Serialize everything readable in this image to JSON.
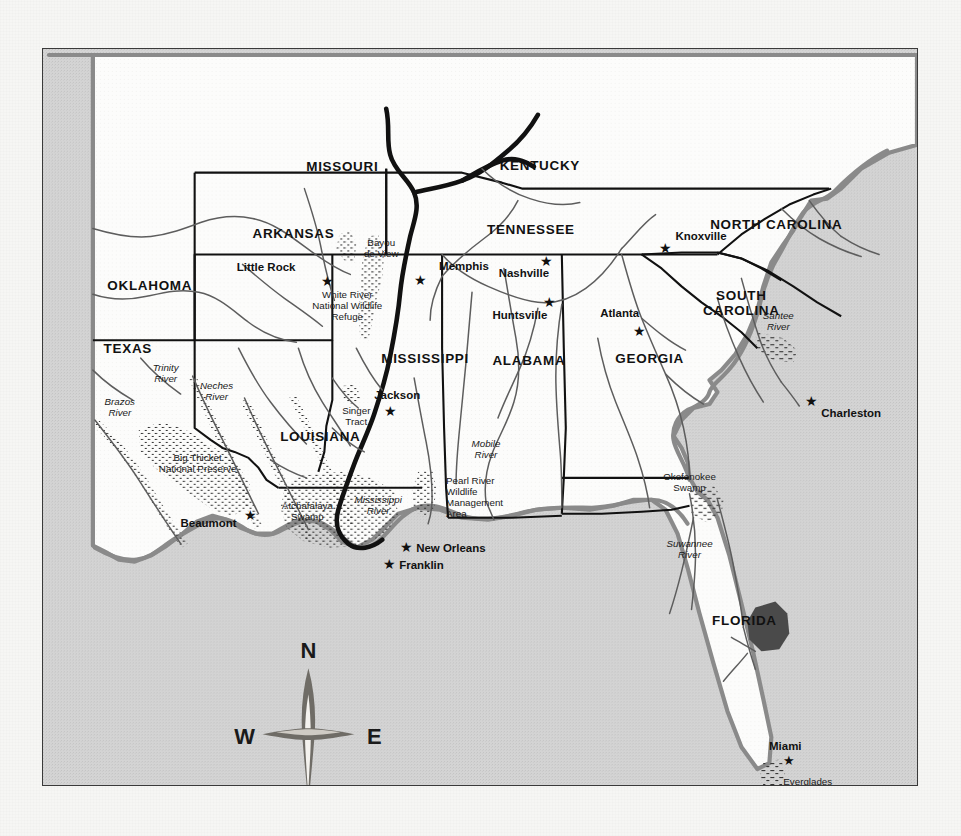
{
  "map": {
    "title": "Southeastern United States — Ivory-billed Woodpecker historic range map",
    "frame": {
      "border_color": "#3a3a3a",
      "ocean_color": "#d2d2d2",
      "land_color": "#fbfbfa"
    },
    "states": [
      {
        "name": "MISSOURI",
        "x": 300,
        "y": 122
      },
      {
        "name": "KENTUCKY",
        "x": 498,
        "y": 121
      },
      {
        "name": "ARKANSAS",
        "x": 251,
        "y": 190
      },
      {
        "name": "TENNESSEE",
        "x": 489,
        "y": 186
      },
      {
        "name": "NORTH CAROLINA",
        "x": 735,
        "y": 180
      },
      {
        "name": "OKLAHOMA",
        "x": 107,
        "y": 242
      },
      {
        "name": "SOUTH CAROLINA",
        "x": 700,
        "y": 258
      },
      {
        "name": "TEXAS",
        "x": 85,
        "y": 305
      },
      {
        "name": "MISSISSIPPI",
        "x": 383,
        "y": 315
      },
      {
        "name": "ALABAMA",
        "x": 487,
        "y": 317
      },
      {
        "name": "GEORGIA",
        "x": 608,
        "y": 315
      },
      {
        "name": "LOUISIANA",
        "x": 278,
        "y": 393
      },
      {
        "name": "FLORIDA",
        "x": 703,
        "y": 578
      }
    ],
    "cities": [
      {
        "name": "Little Rock",
        "lx": 253,
        "ly": 223,
        "sx": 285,
        "sy": 233,
        "anchor": "end"
      },
      {
        "name": "Memphis",
        "lx": 397,
        "ly": 222,
        "sx": 374,
        "sy": 232,
        "anchor": "start"
      },
      {
        "name": "Nashville",
        "lx": 482,
        "ly": 226,
        "sx": 505,
        "sy": 214,
        "anchor": "middle"
      },
      {
        "name": "Knoxville",
        "lx": 634,
        "ly": 192,
        "sx": 609,
        "sy": 201,
        "anchor": "start"
      },
      {
        "name": "Huntsville",
        "lx": 478,
        "ly": 268,
        "sx": 508,
        "sy": 255,
        "anchor": "middle"
      },
      {
        "name": "Atlanta",
        "lx": 578,
        "ly": 269,
        "sx": 598,
        "sy": 284,
        "anchor": "middle"
      },
      {
        "name": "Charleston",
        "lx": 780,
        "ly": 366,
        "sx": 755,
        "sy": 355,
        "anchor": "start"
      },
      {
        "name": "Jackson",
        "lx": 355,
        "ly": 351,
        "sx": 373,
        "sy": 363,
        "anchor": "middle"
      },
      {
        "name": "Beaumont",
        "lx": 166,
        "ly": 476,
        "sx": 196,
        "sy": 470,
        "anchor": "middle"
      },
      {
        "name": "New Orleans",
        "lx": 374,
        "ly": 501,
        "sx": 361,
        "sy": 498,
        "anchor": "start"
      },
      {
        "name": "Franklin",
        "lx": 357,
        "ly": 517,
        "sx": 333,
        "sy": 513,
        "anchor": "start"
      },
      {
        "name": "Miami",
        "lx": 744,
        "ly": 700,
        "sx": 746,
        "sy": 712,
        "anchor": "middle"
      }
    ],
    "features": [
      {
        "name": "Bayou\nde View",
        "x": 339,
        "y": 198,
        "italic": false,
        "align": "middle"
      },
      {
        "name": "White River\nNational Wildlife\nRefuge",
        "x": 305,
        "y": 257,
        "italic": false,
        "align": "middle"
      },
      {
        "name": "Trinity\nRiver",
        "x": 123,
        "y": 323,
        "italic": true,
        "align": "middle"
      },
      {
        "name": "Neches\nRiver",
        "x": 174,
        "y": 341,
        "italic": true,
        "align": "middle"
      },
      {
        "name": "Brazos\nRiver",
        "x": 77,
        "y": 357,
        "italic": true,
        "align": "middle"
      },
      {
        "name": "Big Thicket\nNational Preserve",
        "x": 155,
        "y": 413,
        "italic": false,
        "align": "middle"
      },
      {
        "name": "Singer\nTract",
        "x": 314,
        "y": 366,
        "italic": false,
        "align": "middle"
      },
      {
        "name": "Atchafalaya\nSwamp",
        "x": 265,
        "y": 461,
        "italic": false,
        "align": "middle"
      },
      {
        "name": "Mississippi\nRiver",
        "x": 331,
        "y": 455,
        "italic": true,
        "align": "middle"
      },
      {
        "name": "Pearl River\nWildlife\nManagement\nArea",
        "x": 424,
        "y": 440,
        "italic": false,
        "align": "middle"
      },
      {
        "name": "Mobile\nRiver",
        "x": 444,
        "y": 399,
        "italic": true,
        "align": "middle"
      },
      {
        "name": "Santee\nRiver",
        "x": 737,
        "y": 271,
        "italic": true,
        "align": "middle"
      },
      {
        "name": "Okefenokee\nSwamp",
        "x": 648,
        "y": 432,
        "italic": false,
        "align": "middle"
      },
      {
        "name": "Suwannee\nRiver",
        "x": 648,
        "y": 499,
        "italic": true,
        "align": "middle"
      },
      {
        "name": "Everglades\nNational Park",
        "x": 775,
        "y": 738,
        "italic": false,
        "align": "middle"
      }
    ],
    "compass": {
      "north": "N",
      "south": "S",
      "east": "E",
      "west": "W",
      "cx": 266,
      "cy": 657
    }
  }
}
